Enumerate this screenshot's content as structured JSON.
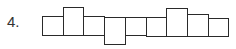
{
  "question": {
    "number_label": "4."
  },
  "figure": {
    "stroke_color": "#2a2a2a",
    "boxes": [
      {
        "x": 42,
        "y": 16,
        "w": 22,
        "h": 20
      },
      {
        "x": 63,
        "y": 7,
        "w": 21,
        "h": 29
      },
      {
        "x": 83,
        "y": 16,
        "w": 22,
        "h": 20
      },
      {
        "x": 104,
        "y": 17,
        "w": 22,
        "h": 28
      },
      {
        "x": 125,
        "y": 17,
        "w": 22,
        "h": 19
      },
      {
        "x": 146,
        "y": 17,
        "w": 21,
        "h": 20
      },
      {
        "x": 166,
        "y": 8,
        "w": 22,
        "h": 29
      },
      {
        "x": 187,
        "y": 14,
        "w": 22,
        "h": 23
      },
      {
        "x": 208,
        "y": 18,
        "w": 21,
        "h": 19
      }
    ]
  }
}
